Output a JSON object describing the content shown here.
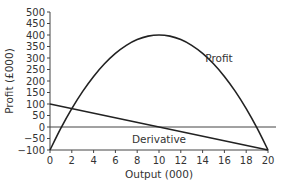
{
  "chart_data": {
    "type": "line",
    "title": "",
    "xlabel": "Output (000)",
    "ylabel": "Profit (£000)",
    "xlim": [
      0,
      20
    ],
    "ylim": [
      -100,
      500
    ],
    "xticks": [
      0,
      2,
      4,
      6,
      8,
      10,
      12,
      14,
      16,
      18,
      20
    ],
    "yticks": [
      -100,
      -50,
      0,
      50,
      100,
      150,
      200,
      250,
      300,
      350,
      400,
      450,
      500
    ],
    "grid": false,
    "reference_line": {
      "y": 0
    },
    "series": [
      {
        "name": "Profit",
        "x": [
          0,
          1,
          2,
          3,
          4,
          5,
          6,
          7,
          8,
          9,
          10,
          11,
          12,
          13,
          14,
          15,
          16,
          17,
          18,
          19,
          20
        ],
        "values": [
          -100,
          -5,
          80,
          155,
          220,
          275,
          320,
          355,
          380,
          395,
          400,
          395,
          380,
          355,
          320,
          275,
          220,
          155,
          80,
          -5,
          -100
        ],
        "label_at": [
          15.5,
          300
        ]
      },
      {
        "name": "Derivative",
        "x": [
          0,
          20
        ],
        "values": [
          100,
          -100
        ],
        "label_at": [
          10,
          -50
        ]
      }
    ],
    "color": "#222222"
  }
}
